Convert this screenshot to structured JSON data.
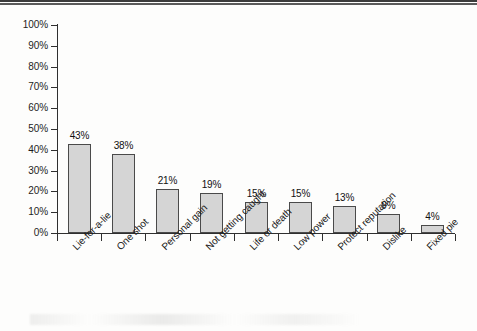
{
  "chart_data": {
    "type": "bar",
    "title": "",
    "subtitle": "",
    "xlabel": "",
    "ylabel": "",
    "ylim": [
      0,
      100
    ],
    "grid": false,
    "legend": null,
    "value_label_suffix": "%",
    "categories": [
      "Lie-for-a-lie",
      "One shot",
      "Personal gain",
      "Not getting caught",
      "Life or death",
      "Low power",
      "Protect reputation",
      "Dislike",
      "Fixed pie"
    ],
    "values": [
      43,
      38,
      21,
      19,
      15,
      15,
      13,
      9,
      4
    ],
    "value_labels": [
      "43%",
      "38%",
      "21%",
      "19%",
      "15%",
      "15%",
      "13%",
      "9%",
      "4%"
    ],
    "y_ticks": [
      0,
      10,
      20,
      30,
      40,
      50,
      60,
      70,
      80,
      90,
      100
    ],
    "y_tick_labels": [
      "0%",
      "10%",
      "20%",
      "30%",
      "40%",
      "50%",
      "60%",
      "70%",
      "80%",
      "90%",
      "100%"
    ],
    "colors": {
      "bar_fill": "#d5d5d5",
      "bar_border": "#4a4a4a",
      "axis": "#2f2f2f",
      "text": "#1a1a1a",
      "background": "#fdfdfc",
      "top_rule": "#3b3b3b"
    }
  }
}
